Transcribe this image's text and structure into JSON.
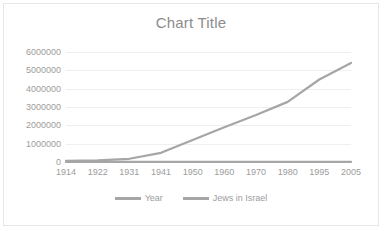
{
  "chart": {
    "title": "Chart Title",
    "background_color": "#FFFFFF",
    "border_color": "#E6E6E6",
    "gridline_color": "#EFEFEF",
    "tick_label_color": "#9C9C9C",
    "title_color": "#8C8C8C"
  },
  "chart_data": {
    "type": "line",
    "title": "Chart Title",
    "xlabel": "",
    "ylabel": "",
    "categories": [
      "1914",
      "1922",
      "1931",
      "1941",
      "1950",
      "1960",
      "1970",
      "1980",
      "1995",
      "2005"
    ],
    "series": [
      {
        "name": "Year",
        "color": "#A6A6A6",
        "values": [
          1914,
          1922,
          1931,
          1941,
          1950,
          1960,
          1970,
          1980,
          1995,
          2005
        ]
      },
      {
        "name": "Jews in Israel",
        "color": "#A6A6A6",
        "values": [
          60000,
          84000,
          175000,
          500000,
          1200000,
          1900000,
          2560000,
          3280000,
          4500000,
          5400000
        ]
      }
    ],
    "ylim": [
      0,
      6000000
    ],
    "ytick_labels": [
      "6000000",
      "5000000",
      "4000000",
      "3000000",
      "2000000",
      "1000000",
      "0"
    ],
    "ytick_values": [
      6000000,
      5000000,
      4000000,
      3000000,
      2000000,
      1000000,
      0
    ],
    "grid": true,
    "grid_axis": "y",
    "legend": true,
    "legend_position": "bottom",
    "legend_entries": [
      "Year",
      "Jews in Israel"
    ]
  }
}
